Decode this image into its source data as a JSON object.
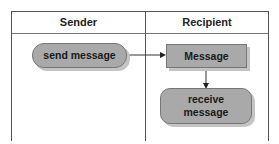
{
  "diagram": {
    "type": "swimlane",
    "lanes": [
      {
        "title": "Sender"
      },
      {
        "title": "Recipient"
      }
    ],
    "nodes": [
      {
        "id": "send",
        "label": "send message",
        "shape": "rounded-pill",
        "lane": "Sender"
      },
      {
        "id": "msg",
        "label": "Message",
        "shape": "rectangle",
        "lane": "Recipient"
      },
      {
        "id": "recv",
        "label": "receive message",
        "shape": "rounded-rectangle",
        "lane": "Recipient"
      }
    ],
    "edges": [
      {
        "from": "send",
        "to": "msg"
      },
      {
        "from": "msg",
        "to": "recv"
      }
    ],
    "colors": {
      "node_fill": "#a9a9a9",
      "border": "#555555",
      "shadow": "#c4c4c4"
    }
  }
}
